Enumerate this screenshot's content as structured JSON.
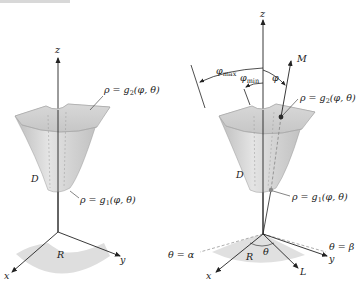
{
  "caption_fragment": "",
  "colors": {
    "surface_fill": "#cfcfcf",
    "surface_dark": "#b4b4b4",
    "surface_light": "#e6e6e6",
    "region_fill": "#dcdcdc",
    "axis": "#222222",
    "dashed": "#8a8a8a",
    "point": "#2a2a2a"
  },
  "left_figure": {
    "axis_z": "z",
    "axis_x": "x",
    "axis_y": "y",
    "region_label": "R",
    "solid_label": "D",
    "upper_surface": {
      "lhs": "ρ = g",
      "sub": "2",
      "rhs": "(φ, θ)"
    },
    "lower_surface": {
      "lhs": "ρ = g",
      "sub": "1",
      "rhs": "(φ, θ)"
    }
  },
  "right_figure": {
    "axis_z": "z",
    "axis_x": "x",
    "axis_y": "y",
    "region_label": "R",
    "solid_label": "D",
    "ray_label": "M",
    "projection_label": "L",
    "phi_label": "φ",
    "phi_max": {
      "base": "φ",
      "sub": "max"
    },
    "phi_min": {
      "base": "φ",
      "sub": "min"
    },
    "theta_label": "θ",
    "theta_alpha": "θ = α",
    "theta_beta": "θ = β",
    "upper_surface": {
      "lhs": "ρ = g",
      "sub": "2",
      "rhs": "(φ, θ)"
    },
    "lower_surface": {
      "lhs": "ρ = g",
      "sub": "1",
      "rhs": "(φ, θ)"
    }
  }
}
